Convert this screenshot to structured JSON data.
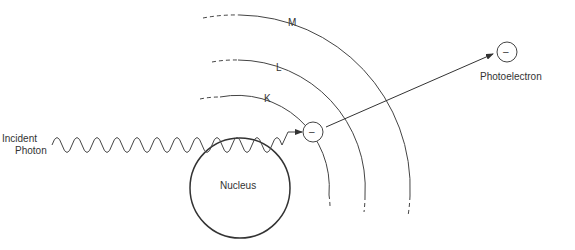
{
  "diagram": {
    "labels": {
      "incident_line1": "Incident",
      "incident_line2": "Photon",
      "nucleus": "Nucleus",
      "photoelectron": "Photoelectron",
      "shell_k": "K",
      "shell_l": "L",
      "shell_m": "M",
      "electron_sign": "–",
      "photoelectron_sign": "–"
    },
    "colors": {
      "stroke": "#333333",
      "background": "#ffffff"
    }
  }
}
